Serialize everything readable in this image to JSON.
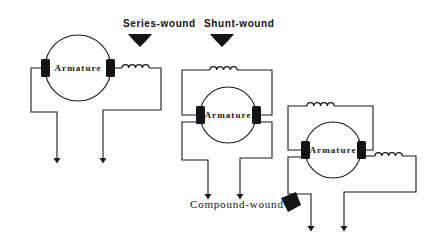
{
  "figure": {
    "background_color": "#ffffff",
    "ink_color": "#1a1a1a",
    "line_width": 1.1
  },
  "labels": {
    "series": "Series-wound",
    "shunt": "Shunt-wound",
    "compound": "Compound-wound"
  },
  "armature_text": "Armature",
  "circuits": [
    {
      "id": "series-wound",
      "name": "Series-wound motor",
      "armature_label": "Armature",
      "circle": {
        "cx": 78,
        "cy": 68,
        "r": 33
      },
      "brushes": [
        {
          "x": 41,
          "y": 60,
          "w": 9,
          "h": 17
        },
        {
          "x": 106,
          "y": 60,
          "w": 9,
          "h": 17
        }
      ],
      "coils": [
        {
          "name": "series-field-coil",
          "x": 124,
          "y": 68,
          "loops": 4,
          "orientation": "horizontal"
        }
      ],
      "leads": [
        {
          "name": "lead-left",
          "arrow_x": 57,
          "arrow_y": 160
        },
        {
          "name": "lead-right",
          "arrow_x": 103,
          "arrow_y": 160
        }
      ]
    },
    {
      "id": "shunt-wound",
      "name": "Shunt-wound motor",
      "armature_label": "Armature",
      "circle": {
        "cx": 228,
        "cy": 115,
        "r": 28
      },
      "brushes": [
        {
          "x": 196,
          "y": 107,
          "w": 9,
          "h": 17
        },
        {
          "x": 252,
          "y": 107,
          "w": 9,
          "h": 17
        }
      ],
      "coils": [
        {
          "name": "shunt-field-coil",
          "x": 228,
          "y": 70,
          "loops": 4,
          "orientation": "horizontal"
        }
      ],
      "leads": [
        {
          "name": "lead-left",
          "arrow_x": 208,
          "arrow_y": 196
        },
        {
          "name": "lead-right",
          "arrow_x": 240,
          "arrow_y": 196
        }
      ]
    },
    {
      "id": "compound-wound",
      "name": "Compound-wound motor",
      "armature_label": "Armature",
      "circle": {
        "cx": 333,
        "cy": 150,
        "r": 28
      },
      "brushes": [
        {
          "x": 301,
          "y": 142,
          "w": 9,
          "h": 17
        },
        {
          "x": 357,
          "y": 142,
          "w": 9,
          "h": 17
        }
      ],
      "coils": [
        {
          "name": "shunt-field-coil",
          "x": 325,
          "y": 106,
          "loops": 4,
          "orientation": "horizontal"
        },
        {
          "name": "series-field-coil",
          "x": 390,
          "y": 152,
          "loops": 4,
          "orientation": "horizontal"
        }
      ],
      "leads": [
        {
          "name": "lead-left",
          "arrow_x": 311,
          "arrow_y": 228
        },
        {
          "name": "lead-right",
          "arrow_x": 344,
          "arrow_y": 228
        }
      ]
    }
  ],
  "callouts": [
    {
      "name": "series-callout-arrow",
      "direction": "down",
      "x": 140,
      "y": 42
    },
    {
      "name": "shunt-callout-arrow",
      "direction": "down",
      "x": 222,
      "y": 42
    },
    {
      "name": "compound-callout-arrow",
      "direction": "down-right",
      "x": 292,
      "y": 200
    }
  ]
}
